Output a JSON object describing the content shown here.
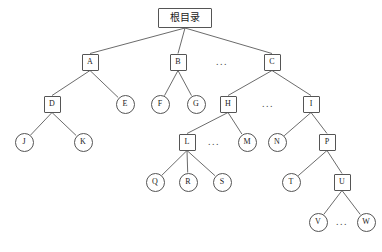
{
  "diagram": {
    "type": "tree",
    "title": "",
    "canvas": {
      "width": 382,
      "height": 252,
      "background": "#ffffff"
    },
    "style": {
      "stroke": "#555555",
      "edge_stroke": "#5a5a5a",
      "text_color": "#1a1a1a",
      "fill": "#ffffff"
    },
    "nodes": [
      {
        "id": "root",
        "label": "根目录",
        "shape": "rect",
        "cx": 185,
        "cy": 18,
        "w": 54,
        "h": 20,
        "font_size": 10
      },
      {
        "id": "A",
        "label": "A",
        "shape": "rect",
        "cx": 90,
        "cy": 62,
        "w": 17,
        "h": 17,
        "font_size": 8
      },
      {
        "id": "B",
        "label": "B",
        "shape": "rect",
        "cx": 178,
        "cy": 62,
        "w": 17,
        "h": 17,
        "font_size": 8
      },
      {
        "id": "C",
        "label": "C",
        "shape": "rect",
        "cx": 272,
        "cy": 62,
        "w": 17,
        "h": 17,
        "font_size": 8
      },
      {
        "id": "D",
        "label": "D",
        "shape": "rect",
        "cx": 52,
        "cy": 104,
        "w": 17,
        "h": 17,
        "font_size": 8
      },
      {
        "id": "E",
        "label": "E",
        "shape": "circle",
        "cx": 125,
        "cy": 104,
        "w": 19,
        "h": 19,
        "font_size": 8
      },
      {
        "id": "F",
        "label": "F",
        "shape": "circle",
        "cx": 160,
        "cy": 104,
        "w": 19,
        "h": 19,
        "font_size": 8
      },
      {
        "id": "G",
        "label": "G",
        "shape": "circle",
        "cx": 196,
        "cy": 104,
        "w": 19,
        "h": 19,
        "font_size": 8
      },
      {
        "id": "H",
        "label": "H",
        "shape": "rect",
        "cx": 228,
        "cy": 104,
        "w": 17,
        "h": 17,
        "font_size": 8
      },
      {
        "id": "I",
        "label": "I",
        "shape": "rect",
        "cx": 311,
        "cy": 104,
        "w": 17,
        "h": 17,
        "font_size": 8
      },
      {
        "id": "J",
        "label": "J",
        "shape": "circle",
        "cx": 24,
        "cy": 142,
        "w": 19,
        "h": 19,
        "font_size": 8
      },
      {
        "id": "K",
        "label": "K",
        "shape": "circle",
        "cx": 83,
        "cy": 142,
        "w": 19,
        "h": 19,
        "font_size": 8
      },
      {
        "id": "L",
        "label": "L",
        "shape": "rect",
        "cx": 187,
        "cy": 142,
        "w": 17,
        "h": 17,
        "font_size": 8
      },
      {
        "id": "M",
        "label": "M",
        "shape": "circle",
        "cx": 247,
        "cy": 142,
        "w": 19,
        "h": 19,
        "font_size": 8
      },
      {
        "id": "N",
        "label": "N",
        "shape": "circle",
        "cx": 277,
        "cy": 142,
        "w": 19,
        "h": 19,
        "font_size": 8
      },
      {
        "id": "P",
        "label": "P",
        "shape": "rect",
        "cx": 327,
        "cy": 142,
        "w": 17,
        "h": 17,
        "font_size": 8
      },
      {
        "id": "Q",
        "label": "Q",
        "shape": "circle",
        "cx": 155,
        "cy": 182,
        "w": 19,
        "h": 19,
        "font_size": 8
      },
      {
        "id": "R",
        "label": "R",
        "shape": "circle",
        "cx": 188,
        "cy": 182,
        "w": 19,
        "h": 19,
        "font_size": 8
      },
      {
        "id": "S",
        "label": "S",
        "shape": "circle",
        "cx": 222,
        "cy": 182,
        "w": 19,
        "h": 19,
        "font_size": 8
      },
      {
        "id": "T",
        "label": "T",
        "shape": "circle",
        "cx": 291,
        "cy": 182,
        "w": 19,
        "h": 19,
        "font_size": 8
      },
      {
        "id": "U",
        "label": "U",
        "shape": "rect",
        "cx": 342,
        "cy": 182,
        "w": 17,
        "h": 17,
        "font_size": 8
      },
      {
        "id": "V",
        "label": "V",
        "shape": "circle",
        "cx": 318,
        "cy": 222,
        "w": 19,
        "h": 19,
        "font_size": 8
      },
      {
        "id": "W",
        "label": "W",
        "shape": "circle",
        "cx": 366,
        "cy": 222,
        "w": 19,
        "h": 19,
        "font_size": 8
      }
    ],
    "ellipses": [
      {
        "id": "ellipsis-root-level2",
        "text": "...",
        "cx": 222,
        "cy": 62,
        "font_size": 10
      },
      {
        "id": "ellipsis-c-children",
        "text": "...",
        "cx": 268,
        "cy": 104,
        "font_size": 10
      },
      {
        "id": "ellipsis-h-children",
        "text": "...",
        "cx": 214,
        "cy": 142,
        "font_size": 10
      },
      {
        "id": "ellipsis-u-children",
        "text": "...",
        "cx": 342,
        "cy": 222,
        "font_size": 10
      }
    ],
    "edges": [
      {
        "from": "root",
        "to": "A"
      },
      {
        "from": "root",
        "to": "B"
      },
      {
        "from": "root",
        "to": "C"
      },
      {
        "from": "A",
        "to": "D"
      },
      {
        "from": "A",
        "to": "E"
      },
      {
        "from": "B",
        "to": "F"
      },
      {
        "from": "B",
        "to": "G"
      },
      {
        "from": "C",
        "to": "H"
      },
      {
        "from": "C",
        "to": "I"
      },
      {
        "from": "D",
        "to": "J"
      },
      {
        "from": "D",
        "to": "K"
      },
      {
        "from": "H",
        "to": "L"
      },
      {
        "from": "H",
        "to": "M"
      },
      {
        "from": "I",
        "to": "N"
      },
      {
        "from": "I",
        "to": "P"
      },
      {
        "from": "L",
        "to": "Q"
      },
      {
        "from": "L",
        "to": "R"
      },
      {
        "from": "L",
        "to": "S"
      },
      {
        "from": "P",
        "to": "T"
      },
      {
        "from": "P",
        "to": "U"
      },
      {
        "from": "U",
        "to": "V"
      },
      {
        "from": "U",
        "to": "W"
      }
    ]
  }
}
